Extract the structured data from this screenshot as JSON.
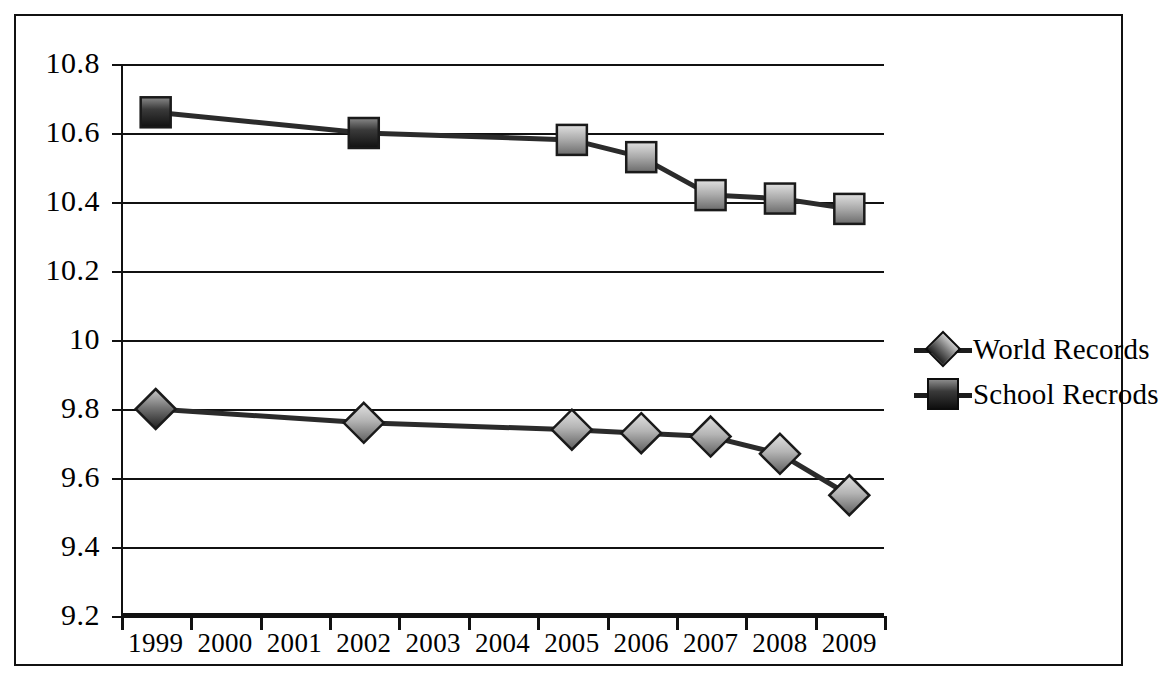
{
  "chart_data": {
    "type": "line",
    "title": "",
    "xlabel": "",
    "ylabel": "",
    "categories": [
      "1999",
      "2000",
      "2001",
      "2002",
      "2003",
      "2004",
      "2005",
      "2006",
      "2007",
      "2008",
      "2009"
    ],
    "ylim": [
      9.2,
      10.8
    ],
    "yticks": [
      "9.2",
      "9.4",
      "9.6",
      "9.8",
      "10",
      "10.2",
      "10.4",
      "10.6",
      "10.8"
    ],
    "ytick_values": [
      9.2,
      9.4,
      9.6,
      9.8,
      10.0,
      10.2,
      10.4,
      10.6,
      10.8
    ],
    "grid": true,
    "legend_position": "right",
    "series": [
      {
        "name": "World Records",
        "marker": "diamond",
        "color": "#8c8c8c",
        "line_color": "#2b2b2b",
        "values": [
          9.8,
          null,
          null,
          9.76,
          null,
          null,
          9.74,
          9.73,
          9.72,
          9.67,
          9.55
        ]
      },
      {
        "name": "School Recrods",
        "marker": "square",
        "color": "#8c8c8c",
        "line_color": "#2b2b2b",
        "values": [
          10.66,
          null,
          null,
          10.6,
          null,
          null,
          10.58,
          10.53,
          10.42,
          10.41,
          10.38
        ]
      }
    ]
  },
  "legend": {
    "entries": [
      {
        "label": "World Records",
        "marker": "diamond"
      },
      {
        "label": "School Recrods",
        "marker": "square"
      }
    ]
  },
  "colors": {
    "axis": "#111111",
    "gridline": "#111111",
    "line": "#2b2b2b",
    "marker_light": "#d8d8d8",
    "marker_dark": "#5a5a5a",
    "background": "#ffffff"
  }
}
